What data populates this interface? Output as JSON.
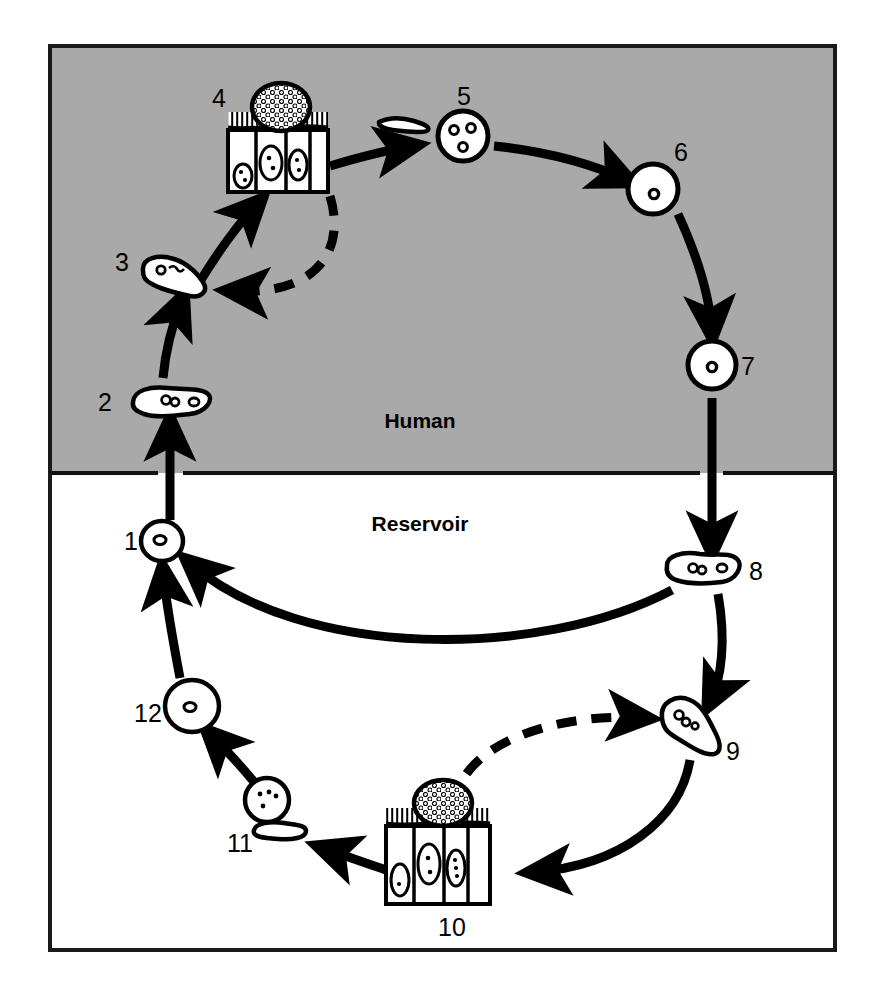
{
  "figure": {
    "frame": {
      "border_color": "#1a1a1a",
      "border_width": 4
    },
    "zones": [
      {
        "id": "human",
        "label": "Human",
        "fill": "#a9a9a9",
        "label_x": 420,
        "label_y": 428
      },
      {
        "id": "reservoir",
        "label": "Reservoir",
        "fill": "#ffffff",
        "label_x": 420,
        "label_y": 531
      }
    ],
    "divider": {
      "y": 473,
      "color": "#111111",
      "width": 4
    },
    "stages": [
      {
        "num": "1",
        "zone": "reservoir",
        "form": "cyst-round-1n",
        "label_x": 131,
        "label_y": 548,
        "cx": 162,
        "cy": 541
      },
      {
        "num": "2",
        "zone": "human",
        "form": "trophozoite-elongate",
        "label_x": 105,
        "label_y": 411,
        "cx": 170,
        "cy": 402
      },
      {
        "num": "3",
        "zone": "human",
        "form": "trophozoite-elongate",
        "label_x": 122,
        "label_y": 271,
        "cx": 178,
        "cy": 277
      },
      {
        "num": "4",
        "zone": "human",
        "form": "epithelium-colony",
        "label_x": 219,
        "label_y": 107,
        "cx": 277,
        "cy": 148
      },
      {
        "num": "5",
        "zone": "human",
        "form": "cyst-round-3n",
        "label_x": 464,
        "label_y": 105,
        "cx": 463,
        "cy": 136
      },
      {
        "num": "6",
        "zone": "human",
        "form": "cyst-round-1n",
        "label_x": 681,
        "label_y": 161,
        "cx": 653,
        "cy": 189
      },
      {
        "num": "7",
        "zone": "human",
        "form": "cyst-round-1n",
        "label_x": 748,
        "label_y": 368,
        "cx": 711,
        "cy": 365
      },
      {
        "num": "8",
        "zone": "reservoir",
        "form": "trophozoite-elongate",
        "label_x": 752,
        "label_y": 578,
        "cx": 702,
        "cy": 570
      },
      {
        "num": "9",
        "zone": "reservoir",
        "form": "trophozoite-pear",
        "label_x": 731,
        "label_y": 757,
        "cx": 684,
        "cy": 724
      },
      {
        "num": "10",
        "zone": "reservoir",
        "form": "epithelium-colony",
        "label_x": 452,
        "label_y": 933,
        "cx": 437,
        "cy": 862
      },
      {
        "num": "11",
        "zone": "reservoir",
        "form": "cyst-round-multi",
        "label_x": 240,
        "label_y": 849,
        "cx": 267,
        "cy": 800
      },
      {
        "num": "12",
        "zone": "reservoir",
        "form": "cyst-round-1n",
        "label_x": 148,
        "label_y": 718,
        "cx": 192,
        "cy": 706
      }
    ],
    "transitions": [
      {
        "from": "1",
        "to": "2",
        "style": "solid",
        "crosses_zone": true
      },
      {
        "from": "2",
        "to": "3",
        "style": "solid",
        "crosses_zone": false
      },
      {
        "from": "3",
        "to": "4",
        "style": "solid",
        "crosses_zone": false
      },
      {
        "from": "4",
        "to": "3",
        "style": "dashed",
        "crosses_zone": false
      },
      {
        "from": "4",
        "to": "5",
        "style": "solid",
        "crosses_zone": false
      },
      {
        "from": "5",
        "to": "6",
        "style": "solid",
        "crosses_zone": false
      },
      {
        "from": "6",
        "to": "7",
        "style": "solid",
        "crosses_zone": false
      },
      {
        "from": "7",
        "to": "8",
        "style": "solid",
        "crosses_zone": true
      },
      {
        "from": "8",
        "to": "9",
        "style": "solid",
        "crosses_zone": false
      },
      {
        "from": "9",
        "to": "10",
        "style": "solid",
        "crosses_zone": false
      },
      {
        "from": "10",
        "to": "9",
        "style": "dashed",
        "crosses_zone": false
      },
      {
        "from": "10",
        "to": "11",
        "style": "solid",
        "crosses_zone": false
      },
      {
        "from": "11",
        "to": "12",
        "style": "solid",
        "crosses_zone": false
      },
      {
        "from": "12",
        "to": "1",
        "style": "solid",
        "crosses_zone": false
      },
      {
        "from": "8",
        "to": "1",
        "style": "solid",
        "crosses_zone": false
      }
    ]
  }
}
